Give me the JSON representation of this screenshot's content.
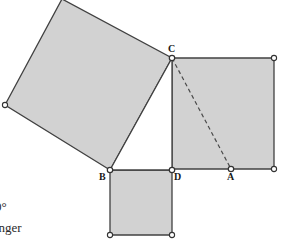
{
  "figure": {
    "kind": "pythagorean-theorem-diagram",
    "background_color": "#ffffff",
    "fill_color": "#d2d2d2",
    "stroke_color": "#414141",
    "dashed_stroke_color": "#4a4a4a",
    "vertex_marker_fill": "#ffffff",
    "vertex_marker_stroke": "#333333",
    "canvas": {
      "width": 281,
      "height": 242
    }
  },
  "points": {
    "A": {
      "x": 231,
      "y": 169,
      "label": "A",
      "label_x": 227,
      "label_y": 172
    },
    "B": {
      "x": 110,
      "y": 170,
      "label": "B",
      "label_x": 99,
      "label_y": 172
    },
    "C": {
      "x": 172,
      "y": 58,
      "label": "C",
      "label_x": 168,
      "label_y": 44
    },
    "D": {
      "x": 172,
      "y": 170,
      "label": "D",
      "label_x": 174,
      "label_y": 172
    }
  },
  "shapes": {
    "hypotenuse_square": {
      "name": "square-on-hypotenuse-BC",
      "filled": true,
      "points": "110,170 5,105 62,-1 172,58",
      "vertices": [
        {
          "x": 5,
          "y": 105,
          "visible": true
        },
        {
          "x": 62,
          "y": -1,
          "visible": false
        },
        {
          "x": 172,
          "y": 58,
          "visible": true
        },
        {
          "x": 110,
          "y": 170,
          "visible": true
        }
      ]
    },
    "leg_square_right": {
      "name": "square-on-leg-CD",
      "filled": true,
      "points": "172,58 274,58 274,169 172,169",
      "vertices": [
        {
          "x": 172,
          "y": 58,
          "visible": true
        },
        {
          "x": 274,
          "y": 58,
          "visible": true
        },
        {
          "x": 274,
          "y": 169,
          "visible": true
        },
        {
          "x": 172,
          "y": 169,
          "visible": true
        }
      ]
    },
    "leg_square_bottom": {
      "name": "square-on-leg-BD",
      "filled": true,
      "points": "110,170 172,170 172,235 110,235",
      "vertices": [
        {
          "x": 110,
          "y": 170,
          "visible": true
        },
        {
          "x": 172,
          "y": 170,
          "visible": true
        },
        {
          "x": 172,
          "y": 235,
          "visible": true
        },
        {
          "x": 110,
          "y": 235,
          "visible": true
        }
      ]
    },
    "right_triangle": {
      "name": "right-triangle-BCD",
      "filled": false,
      "points": "110,170 172,58 172,170"
    },
    "dashed_segment": {
      "name": "dashed-segment-CA",
      "x1": 172,
      "y1": 58,
      "x2": 231,
      "y2": 169,
      "dash_pattern": "4,3"
    }
  },
  "annotations": {
    "clipped_angle": "0°",
    "clipped_word": "onger"
  }
}
